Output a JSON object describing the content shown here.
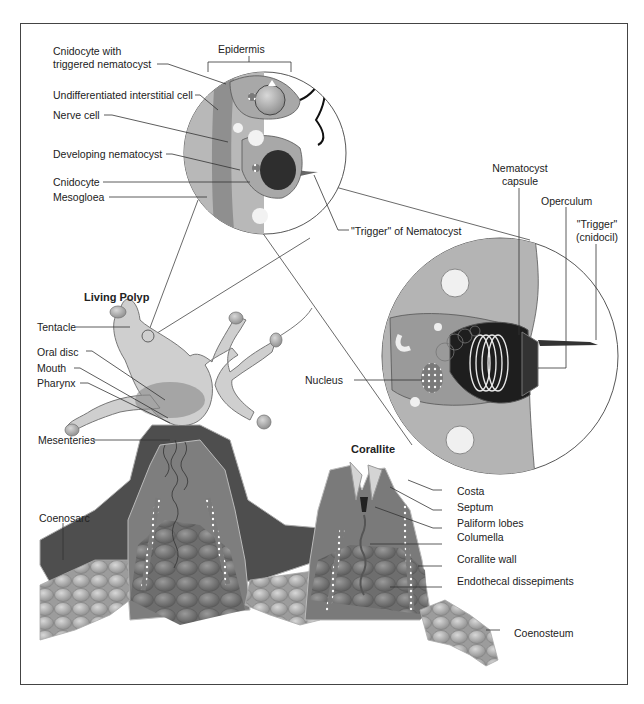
{
  "figure": {
    "type": "labeled anatomical diagram"
  },
  "headings": {
    "living_polyp": "Living Polyp",
    "corallite": "Corallite"
  },
  "labels": {
    "epidermis": "Epidermis",
    "cnidocyte_triggered_line1": "Cnidocyte with",
    "cnidocyte_triggered_line2": "triggered nematocyst",
    "interstitial_cell": "Undifferentiated interstitial cell",
    "nerve_cell": "Nerve cell",
    "developing_nematocyst": "Developing nematocyst",
    "cnidocyte": "Cnidocyte",
    "mesogloea": "Mesogloea",
    "trigger_of_nematocyst": "\"Trigger\" of Nematocyst",
    "nematocyst_capsule_line1": "Nematocyst",
    "nematocyst_capsule_line2": "capsule",
    "operculum": "Operculum",
    "trigger_cnidocil_line1": "\"Trigger\"",
    "trigger_cnidocil_line2": "(cnidocil)",
    "nucleus": "Nucleus",
    "tentacle": "Tentacle",
    "oral_disc": "Oral disc",
    "mouth": "Mouth",
    "pharynx": "Pharynx",
    "mesenteries": "Mesenteries",
    "coenosarc": "Coenosarc",
    "costa": "Costa",
    "septum": "Septum",
    "paliform_lobes": "Paliform lobes",
    "columella": "Columella",
    "corallite_wall": "Corallite wall",
    "endothecal_dissepiments": "Endothecal dissepiments",
    "coenosteum": "Coenosteum"
  },
  "colors": {
    "tissue_light": "#c8c8c8",
    "tissue_mid": "#9a9a9a",
    "tissue_dark": "#555555",
    "skeleton": "#8a8a8a",
    "line": "#333333"
  }
}
